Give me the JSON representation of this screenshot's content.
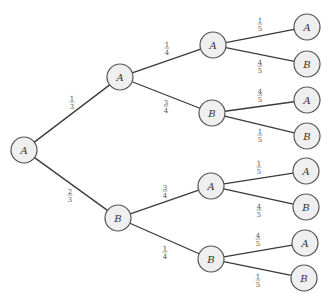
{
  "diagram": {
    "type": "probability-tree",
    "colors": {
      "edge": "#3a3a3a",
      "node_fill": "#efefef",
      "node_stroke": "#555555",
      "text": "#333333"
    },
    "node_radius": 13,
    "nodes": [
      {
        "id": "root",
        "label": "A",
        "x": 24,
        "y": 150
      },
      {
        "id": "L1A",
        "label": "A",
        "x": 120,
        "y": 77
      },
      {
        "id": "L1B",
        "label": "B",
        "x": 118,
        "y": 218
      },
      {
        "id": "L2AA",
        "label": "A",
        "x": 213,
        "y": 45
      },
      {
        "id": "L2AB",
        "label": "B",
        "x": 212,
        "y": 113
      },
      {
        "id": "L2BA",
        "label": "A",
        "x": 211,
        "y": 186
      },
      {
        "id": "L2BB",
        "label": "B",
        "x": 211,
        "y": 259
      },
      {
        "id": "L3AAA",
        "label": "A",
        "x": 307,
        "y": 27
      },
      {
        "id": "L3AAB",
        "label": "B",
        "x": 307,
        "y": 64
      },
      {
        "id": "L3ABA",
        "label": "A",
        "x": 307,
        "y": 100
      },
      {
        "id": "L3ABB",
        "label": "B",
        "x": 307,
        "y": 136
      },
      {
        "id": "L3BAA",
        "label": "A",
        "x": 306,
        "y": 171
      },
      {
        "id": "L3BAB",
        "label": "B",
        "x": 306,
        "y": 207
      },
      {
        "id": "L3BBA",
        "label": "A",
        "x": 305,
        "y": 243
      },
      {
        "id": "L3BBB",
        "label": "B",
        "x": 304,
        "y": 278
      }
    ],
    "edges": [
      {
        "from": "root",
        "to": "L1A",
        "num": "1",
        "den": "3",
        "lx": 72,
        "ly": 102
      },
      {
        "from": "root",
        "to": "L1B",
        "num": "2",
        "den": "3",
        "lx": 70,
        "ly": 195
      },
      {
        "from": "L1A",
        "to": "L2AA",
        "num": "1",
        "den": "4",
        "lx": 167,
        "ly": 48
      },
      {
        "from": "L1A",
        "to": "L2AB",
        "num": "3",
        "den": "4",
        "lx": 166,
        "ly": 106
      },
      {
        "from": "L1B",
        "to": "L2BA",
        "num": "3",
        "den": "4",
        "lx": 165,
        "ly": 191
      },
      {
        "from": "L1B",
        "to": "L2BB",
        "num": "1",
        "den": "4",
        "lx": 165,
        "ly": 252
      },
      {
        "from": "L2AA",
        "to": "L3AAA",
        "num": "1",
        "den": "5",
        "lx": 260,
        "ly": 24
      },
      {
        "from": "L2AA",
        "to": "L3AAB",
        "num": "4",
        "den": "5",
        "lx": 260,
        "ly": 66
      },
      {
        "from": "L2AB",
        "to": "L3ABA",
        "num": "4",
        "den": "5",
        "lx": 260,
        "ly": 95
      },
      {
        "from": "L2AB",
        "to": "L3ABB",
        "num": "1",
        "den": "5",
        "lx": 260,
        "ly": 135
      },
      {
        "from": "L2BA",
        "to": "L3BAA",
        "num": "1",
        "den": "5",
        "lx": 259,
        "ly": 167
      },
      {
        "from": "L2BA",
        "to": "L3BAB",
        "num": "4",
        "den": "5",
        "lx": 259,
        "ly": 210
      },
      {
        "from": "L2BB",
        "to": "L3BBA",
        "num": "4",
        "den": "5",
        "lx": 258,
        "ly": 239
      },
      {
        "from": "L2BB",
        "to": "L3BBB",
        "num": "1",
        "den": "5",
        "lx": 258,
        "ly": 280
      }
    ]
  }
}
